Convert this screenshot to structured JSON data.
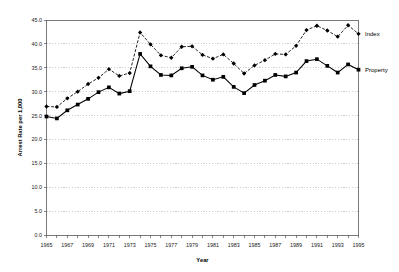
{
  "chart_data": {
    "type": "line",
    "title": "",
    "xlabel": "Year",
    "ylabel": "Arrest Rate per 1,000",
    "xlim": [
      1965,
      1995
    ],
    "ylim": [
      0.0,
      45.0
    ],
    "yticks": [
      "0.0",
      "5.0",
      "10.0",
      "15.0",
      "20.0",
      "25.0",
      "30.0",
      "35.0",
      "40.0",
      "45.0"
    ],
    "ytick_values": [
      0,
      5,
      10,
      15,
      20,
      25,
      30,
      35,
      40,
      45
    ],
    "xticks": [
      "1965",
      "1967",
      "1969",
      "1971",
      "1973",
      "1975",
      "1977",
      "1979",
      "1981",
      "1983",
      "1985",
      "1987",
      "1989",
      "1991",
      "1993",
      "1995"
    ],
    "xtick_values": [
      1965,
      1967,
      1969,
      1971,
      1973,
      1975,
      1977,
      1979,
      1981,
      1983,
      1985,
      1987,
      1989,
      1991,
      1993,
      1995
    ],
    "grid": true,
    "grid_axis": "y",
    "legend_position": "right-inline",
    "x": [
      1965,
      1966,
      1967,
      1968,
      1969,
      1970,
      1971,
      1972,
      1973,
      1974,
      1975,
      1976,
      1977,
      1978,
      1979,
      1980,
      1981,
      1982,
      1983,
      1984,
      1985,
      1986,
      1987,
      1988,
      1989,
      1990,
      1991,
      1992,
      1993,
      1994,
      1995
    ],
    "series": [
      {
        "name": "Index",
        "label": "Index",
        "color": "#000000",
        "linestyle": "dashed",
        "marker": "diamond",
        "values": [
          26.9,
          26.8,
          28.6,
          30.0,
          31.6,
          32.9,
          34.7,
          33.3,
          33.9,
          42.4,
          39.9,
          37.6,
          37.1,
          39.4,
          39.5,
          37.7,
          36.9,
          37.8,
          35.9,
          33.8,
          35.5,
          36.6,
          37.9,
          37.8,
          39.6,
          42.9,
          43.8,
          42.8,
          41.5,
          43.9,
          42.1
        ]
      },
      {
        "name": "Property",
        "label": "Property",
        "color": "#000000",
        "linestyle": "solid",
        "marker": "square",
        "values": [
          24.8,
          24.4,
          26.1,
          27.3,
          28.5,
          29.9,
          30.9,
          29.6,
          30.1,
          37.9,
          35.3,
          33.5,
          33.4,
          34.9,
          35.2,
          33.4,
          32.5,
          33.1,
          31.0,
          29.7,
          31.4,
          32.3,
          33.5,
          33.2,
          34.0,
          36.4,
          36.8,
          35.4,
          34.0,
          35.7,
          34.6
        ]
      }
    ]
  }
}
